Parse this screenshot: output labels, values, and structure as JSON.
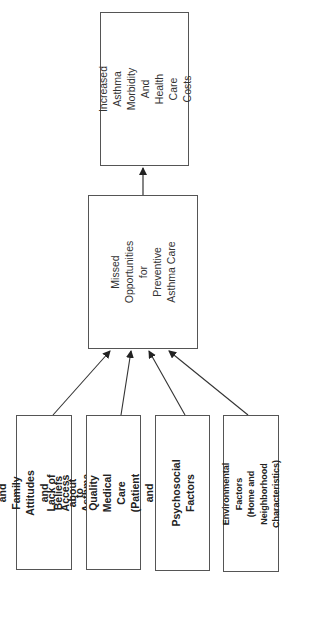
{
  "diagram": {
    "orientation": "rotated-90-ccw",
    "outcome_box": {
      "label": "Increased Asthma\nMorbidity\nAnd Health Care\nCosts"
    },
    "central_box": {
      "label": "Missed\nOpportunities\nfor\nPreventive\nAsthma Care"
    },
    "factor_boxes": [
      {
        "label": "Caregiver and Family\nAttitudes and Beliefs\nabout Asthma Care"
      },
      {
        "label": "Lack of Access to Quality\nMedical Care (Patient and\nProvider Factors)"
      },
      {
        "label": "Psychosocial Factors"
      },
      {
        "label": "Environmental Factors\n(Home and Neighborhood\nCharacteristics)"
      }
    ],
    "edges": [
      {
        "from": "factor_boxes.0",
        "to": "central_box"
      },
      {
        "from": "factor_boxes.1",
        "to": "central_box"
      },
      {
        "from": "factor_boxes.2",
        "to": "central_box"
      },
      {
        "from": "factor_boxes.3",
        "to": "central_box"
      },
      {
        "from": "central_box",
        "to": "outcome_box"
      }
    ],
    "colors": {
      "border": "#555555",
      "arrow": "#333333",
      "background": "#ffffff"
    }
  }
}
